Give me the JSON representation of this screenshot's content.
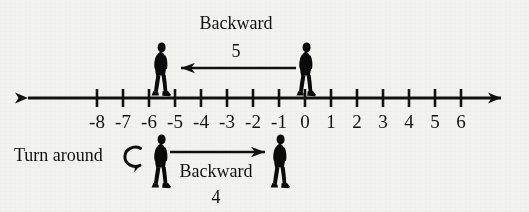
{
  "diagram": {
    "title_hidden": "Number line showing backward moves and a turn around",
    "background_color": "#f2f2f1",
    "ink_color": "#111111",
    "number_line": {
      "name": "number-line",
      "tick_labels": [
        "-8",
        "-7",
        "-6",
        "-5",
        "-4",
        "-3",
        "-2",
        "-1",
        "0",
        "1",
        "2",
        "3",
        "4",
        "5",
        "6"
      ],
      "tick_values": [
        -8,
        -7,
        -6,
        -5,
        -4,
        -3,
        -2,
        -1,
        0,
        1,
        2,
        3,
        4,
        5,
        6
      ],
      "axis_y": 98,
      "left_arrow_end_x": 16,
      "right_arrow_end_x": 513,
      "pixels_per_unit": 26,
      "origin_x": 305,
      "double_headed": true
    },
    "top_move": {
      "name": "backward-five-move",
      "label": "Backward",
      "amount": "5",
      "from_value": 0,
      "to_value": -5,
      "direction": "left",
      "arrow_from_x": 295,
      "arrow_to_x": 168,
      "arrow_y": 68
    },
    "bottom_move": {
      "name": "backward-four-move",
      "turn_label": "Turn around",
      "turn_icon": "turn-around-curved-arrow-icon",
      "label": "Backward",
      "amount": "4",
      "from_value": -5,
      "to_value": -1,
      "direction": "right",
      "arrow_from_x": 168,
      "arrow_to_x": 276,
      "arrow_y": 152
    },
    "figures": [
      {
        "name": "person-figure-top-at-minus-five",
        "value": -5,
        "x": 160,
        "y": 44,
        "row": "top",
        "facing": "right"
      },
      {
        "name": "person-figure-top-at-zero",
        "value": 0,
        "x": 305,
        "y": 44,
        "row": "top",
        "facing": "right"
      },
      {
        "name": "person-figure-bottom-at-minus-five",
        "value": -5,
        "x": 160,
        "y": 140,
        "row": "bottom",
        "facing": "right"
      },
      {
        "name": "person-figure-bottom-at-minus-one",
        "value": -1,
        "x": 279,
        "y": 140,
        "row": "bottom",
        "facing": "right"
      }
    ]
  },
  "text": {
    "backward_top": "Backward",
    "five": "5",
    "turn_around": "Turn around",
    "backward_bottom": "Backward",
    "four": "4"
  }
}
